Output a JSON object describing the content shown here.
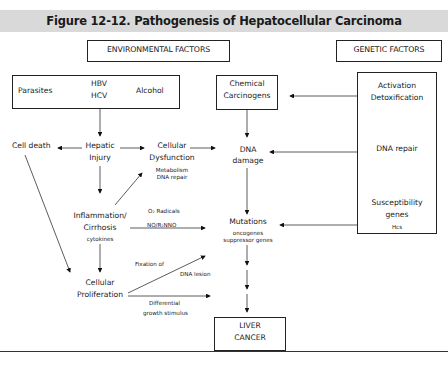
{
  "title": "Figure 12-12. Pathogenesis of Hepatocellular Carcinoma",
  "headers": {
    "environmental": "ENVIRONMENTAL FACTORS",
    "genetic": "GENETIC FACTORS"
  },
  "env_box": {
    "parasites": "Parasites",
    "hbv": "HBV",
    "hcv": "HCV",
    "alcohol": "Alcohol"
  },
  "chemical": {
    "line1": "Chemical",
    "line2": "Carcinogens"
  },
  "genetic_box": {
    "activation": "Activation",
    "detoxification": "Detoxification",
    "dna_repair": "DNA repair",
    "susceptibility": "Susceptibility",
    "genes": "genes",
    "hcs": "Hcs"
  },
  "nodes": {
    "cell_death": "Cell death",
    "hepatic_1": "Hepatic",
    "hepatic_2": "Injury",
    "cellular_1": "Cellular",
    "cellular_2": "Dysfunction",
    "cellular_sub1": "Metabolism",
    "cellular_sub2": "DNA repair",
    "dna_1": "DNA",
    "dna_2": "damage",
    "inflam_1": "Inflammation/",
    "inflam_2": "Cirrhosis",
    "inflam_sub": "cytokines",
    "mutations": "Mutations",
    "mut_sub1": "oncogenes",
    "mut_sub2": "suppressor genes",
    "prolif_1": "Cellular",
    "prolif_2": "Proliferation",
    "liver_1": "LIVER",
    "liver_2": "CANCER"
  },
  "edge_labels": {
    "o2": "O₂ Radicals",
    "no": "NO/R₂NNO",
    "fixation": "Fixation of",
    "dna_lesion": "DNA lesion",
    "differential": "Differential",
    "growth": "growth stimulus"
  }
}
